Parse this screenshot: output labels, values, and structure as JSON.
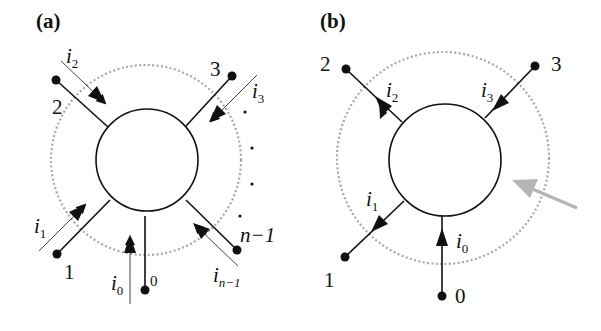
{
  "figure": {
    "panels": [
      {
        "id": "a",
        "label": "(a)",
        "nodes": [
          {
            "id": "0",
            "label": "0"
          },
          {
            "id": "1",
            "label": "1"
          },
          {
            "id": "2",
            "label": "2"
          },
          {
            "id": "3",
            "label": "3"
          },
          {
            "id": "n-1",
            "label": "n−1"
          }
        ],
        "currents": [
          {
            "name": "i",
            "sub": "0",
            "direction": "into-vertex",
            "style": "parallel-arrow"
          },
          {
            "name": "i",
            "sub": "1",
            "direction": "into-vertex",
            "style": "parallel-arrow"
          },
          {
            "name": "i",
            "sub": "2",
            "direction": "into-vertex",
            "style": "parallel-arrow"
          },
          {
            "name": "i",
            "sub": "3",
            "direction": "into-vertex",
            "style": "parallel-arrow"
          },
          {
            "name": "i",
            "sub": "n−1",
            "direction": "into-vertex",
            "style": "parallel-arrow"
          }
        ],
        "ellipsis": "⋮"
      },
      {
        "id": "b",
        "label": "(b)",
        "nodes": [
          {
            "id": "0",
            "label": "0"
          },
          {
            "id": "1",
            "label": "1"
          },
          {
            "id": "2",
            "label": "2"
          },
          {
            "id": "3",
            "label": "3"
          }
        ],
        "currents": [
          {
            "name": "i",
            "sub": "0",
            "direction": "into-vertex",
            "style": "on-line-arrow"
          },
          {
            "name": "i",
            "sub": "1",
            "direction": "out-of-vertex",
            "style": "on-line-arrow"
          },
          {
            "name": "i",
            "sub": "2",
            "direction": "out-of-vertex",
            "style": "on-line-arrow"
          },
          {
            "name": "i",
            "sub": "3",
            "direction": "into-vertex",
            "style": "on-line-arrow"
          }
        ],
        "pointer_arrow": {
          "color": "#b5b5b5"
        }
      }
    ],
    "colors": {
      "line": "#111111",
      "dotted_circle": "#a8a8a8",
      "pointer_arrow": "#b5b5b5",
      "background": "#ffffff"
    }
  }
}
